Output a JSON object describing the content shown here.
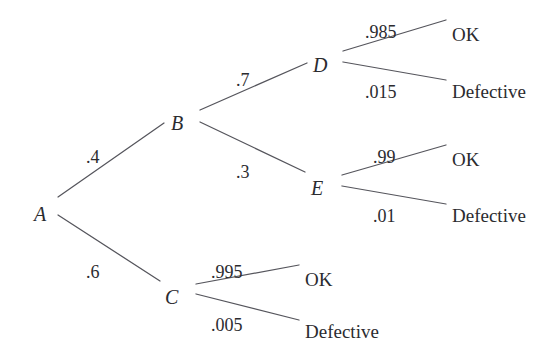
{
  "diagram": {
    "type": "probability-tree",
    "line_color": "#55555c",
    "text_color": "#2b2b2f",
    "background_color": "#ffffff",
    "nodes": [
      {
        "id": "A",
        "label": "A",
        "x": 34,
        "y": 204,
        "vertex_x": 48,
        "vertex_y": 206
      },
      {
        "id": "B",
        "label": "B",
        "x": 171,
        "y": 113,
        "vertex_x": 192,
        "vertex_y": 115
      },
      {
        "id": "C",
        "label": "C",
        "x": 165,
        "y": 287,
        "vertex_x": 188,
        "vertex_y": 288
      },
      {
        "id": "D",
        "label": "D",
        "x": 313,
        "y": 55,
        "vertex_x": 335,
        "vertex_y": 56
      },
      {
        "id": "E",
        "label": "E",
        "x": 311,
        "y": 178,
        "vertex_x": 334,
        "vertex_y": 179
      }
    ],
    "leaves": [
      {
        "id": "D-ok",
        "label": "OK",
        "x": 452,
        "y": 25
      },
      {
        "id": "D-defective",
        "label": "Defective",
        "x": 452,
        "y": 82
      },
      {
        "id": "E-ok",
        "label": "OK",
        "x": 452,
        "y": 150
      },
      {
        "id": "E-defective",
        "label": "Defective",
        "x": 452,
        "y": 206
      },
      {
        "id": "C-ok",
        "label": "OK",
        "x": 305,
        "y": 270
      },
      {
        "id": "C-defective",
        "label": "Defective",
        "x": 305,
        "y": 322
      }
    ],
    "branches": [
      {
        "id": "A-B",
        "from": "A",
        "to": "B",
        "probability": ".4",
        "label_x": 86,
        "label_y": 148,
        "x1": 58,
        "y1": 197,
        "x2": 164,
        "y2": 123
      },
      {
        "id": "A-C",
        "from": "A",
        "to": "C",
        "probability": ".6",
        "label_x": 86,
        "label_y": 263,
        "x1": 58,
        "y1": 215,
        "x2": 160,
        "y2": 281
      },
      {
        "id": "B-D",
        "from": "B",
        "to": "D",
        "probability": ".7",
        "label_x": 236,
        "label_y": 71,
        "x1": 200,
        "y1": 110,
        "x2": 307,
        "y2": 63
      },
      {
        "id": "B-E",
        "from": "B",
        "to": "E",
        "probability": ".3",
        "label_x": 236,
        "label_y": 163,
        "x1": 200,
        "y1": 122,
        "x2": 305,
        "y2": 172
      },
      {
        "id": "D-OK",
        "from": "D",
        "to": "D-ok",
        "probability": ".985",
        "label_x": 365,
        "label_y": 23,
        "x1": 343,
        "y1": 51,
        "x2": 446,
        "y2": 20
      },
      {
        "id": "D-Defective",
        "from": "D",
        "to": "D-defective",
        "probability": ".015",
        "label_x": 365,
        "label_y": 83,
        "x1": 343,
        "y1": 62,
        "x2": 446,
        "y2": 80
      },
      {
        "id": "E-OK",
        "from": "E",
        "to": "E-ok",
        "probability": ".99",
        "label_x": 373,
        "label_y": 148,
        "x1": 342,
        "y1": 175,
        "x2": 446,
        "y2": 145
      },
      {
        "id": "E-Defective",
        "from": "E",
        "to": "E-defective",
        "probability": ".01",
        "label_x": 373,
        "label_y": 207,
        "x1": 342,
        "y1": 186,
        "x2": 446,
        "y2": 204
      },
      {
        "id": "C-OK",
        "from": "C",
        "to": "C-ok",
        "probability": ".995",
        "label_x": 211,
        "label_y": 263,
        "x1": 196,
        "y1": 284,
        "x2": 299,
        "y2": 265
      },
      {
        "id": "C-Defective",
        "from": "C",
        "to": "C-defective",
        "probability": ".005",
        "label_x": 211,
        "label_y": 316,
        "x1": 196,
        "y1": 294,
        "x2": 299,
        "y2": 320
      }
    ]
  }
}
